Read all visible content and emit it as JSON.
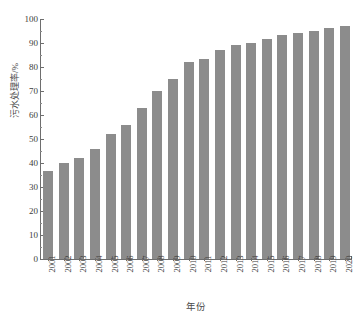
{
  "chart_data": {
    "type": "bar",
    "title": "",
    "xlabel": "年份",
    "ylabel": "污水处理率/%",
    "categories": [
      "2001",
      "2002",
      "2003",
      "2004",
      "2005",
      "2006",
      "2007",
      "2008",
      "2009",
      "2010",
      "2011",
      "2012",
      "2013",
      "2014",
      "2015",
      "2016",
      "2017",
      "2018",
      "2019",
      "2020"
    ],
    "values": [
      36.5,
      39.8,
      42.2,
      45.7,
      52.0,
      55.7,
      62.8,
      70.2,
      75.2,
      82.1,
      83.5,
      87.2,
      89.2,
      90.0,
      91.8,
      93.2,
      94.2,
      95.2,
      96.4,
      97.0
    ],
    "series": [
      {
        "name": "污水处理率",
        "values": [
          36.5,
          39.8,
          42.2,
          45.7,
          52.0,
          55.7,
          62.8,
          70.2,
          75.2,
          82.1,
          83.5,
          87.2,
          89.2,
          90.0,
          91.8,
          93.2,
          94.2,
          95.2,
          96.4,
          97.0
        ]
      }
    ],
    "ylim": [
      0,
      100
    ],
    "ytick_labels": [
      "0",
      "10",
      "20",
      "30",
      "40",
      "50",
      "60",
      "70",
      "80",
      "90",
      "100"
    ],
    "ytick_values": [
      0,
      10,
      20,
      30,
      40,
      50,
      60,
      70,
      80,
      90,
      100
    ],
    "y_minor_step": 5,
    "grid": false,
    "legend": "none",
    "bar_color": "#8c8c8c",
    "axis_color": "#6e6e6e",
    "text_color": "#3c3c3c",
    "background": "#ffffff"
  }
}
